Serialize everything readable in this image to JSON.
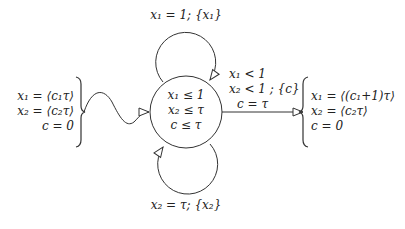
{
  "diagram": {
    "type": "timed-automaton",
    "colors": {
      "stroke": "#333333",
      "text": "#222222",
      "background": "#ffffff"
    },
    "location": {
      "invariant_lines": [
        "x₁ ≤ 1",
        "x₂ ≤ τ",
        "c ≤ τ"
      ]
    },
    "self_loop_top": {
      "label": "x₁ = 1; {x₁}"
    },
    "self_loop_bottom": {
      "label": "x₂ = τ; {x₂}"
    },
    "initial_valuation": {
      "lines": [
        "x₁ = ⟨c₁τ⟩",
        "x₂ = ⟨c₂τ⟩",
        "c = 0"
      ]
    },
    "exit_edge": {
      "guard_lines": [
        "x₁ < 1",
        "x₂ < 1 ; {c}",
        "c = τ"
      ]
    },
    "final_valuation": {
      "lines": [
        "x₁ = ⟨(c₁+1)τ⟩",
        "x₂ = ⟨c₂τ⟩",
        "c = 0"
      ]
    }
  }
}
